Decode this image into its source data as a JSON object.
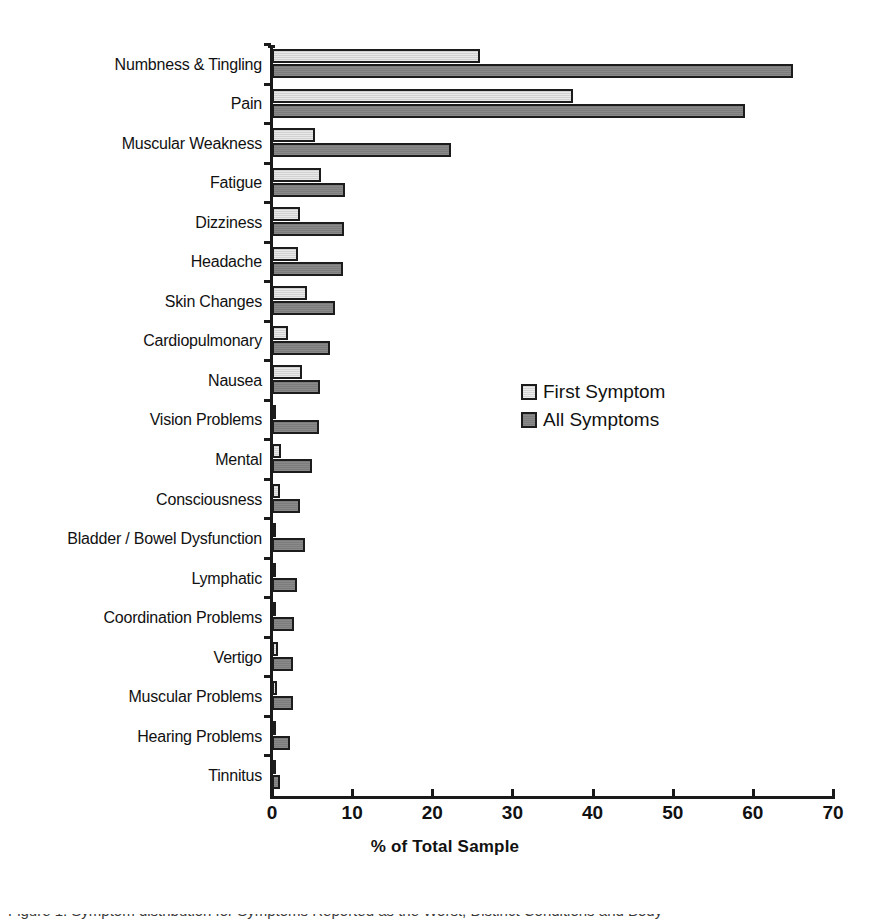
{
  "chart_data": {
    "type": "bar",
    "orientation": "horizontal",
    "title": "",
    "xlabel": "% of Total Sample",
    "ylabel": "",
    "xlim": [
      0,
      70
    ],
    "xticks": [
      0,
      10,
      20,
      30,
      40,
      50,
      60,
      70
    ],
    "grid": false,
    "legend_position": "center-right",
    "categories": [
      "Numbness & Tingling",
      "Pain",
      "Muscular Weakness",
      "Fatigue",
      "Dizziness",
      "Headache",
      "Skin Changes",
      "Cardiopulmonary",
      "Nausea",
      "Vision Problems",
      "Mental",
      "Consciousness",
      "Bladder / Bowel Dysfunction",
      "Lymphatic",
      "Coordination Problems",
      "Vertigo",
      "Muscular Problems",
      "Hearing Problems",
      "Tinnitus"
    ],
    "series": [
      {
        "name": "First Symptom",
        "color": "#ececec",
        "values": [
          26.0,
          37.5,
          5.4,
          6.1,
          3.5,
          3.2,
          4.4,
          2.0,
          3.7,
          0.3,
          1.1,
          1.0,
          0.1,
          0.5,
          0.5,
          0.8,
          0.6,
          0.2,
          0.4
        ]
      },
      {
        "name": "All Symptoms",
        "color": "#8a8a8a",
        "values": [
          65.0,
          59.0,
          22.3,
          9.1,
          9.0,
          8.8,
          7.8,
          7.2,
          6.0,
          5.9,
          5.0,
          3.5,
          4.1,
          3.1,
          2.8,
          2.6,
          2.6,
          2.2,
          1.0
        ]
      }
    ]
  },
  "axis": {
    "x_title": "% of Total Sample",
    "tick_labels": [
      "0",
      "10",
      "20",
      "30",
      "40",
      "50",
      "60",
      "70"
    ]
  },
  "legend": {
    "entries": [
      {
        "label": "First Symptom",
        "style": "first"
      },
      {
        "label": "All Symptoms",
        "style": "all"
      }
    ]
  },
  "caption": {
    "partial_text": "Figure 1. Symptom distribution for Symptoms Reported as the Worst, Distinct Conditions and Body"
  },
  "colors": {
    "axis": "#1a1a1a",
    "bar_outline": "#1c1c1c",
    "first_symptom_fill": "#ececec",
    "all_symptoms_fill": "#8a8a8a",
    "background": "#ffffff"
  }
}
